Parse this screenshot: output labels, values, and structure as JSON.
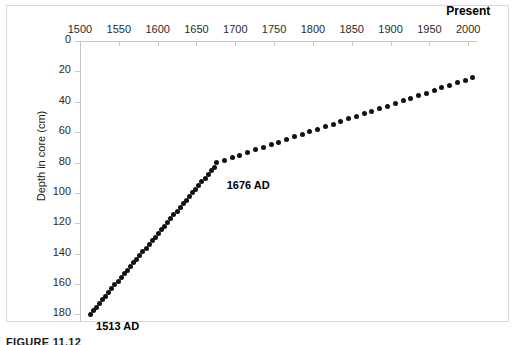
{
  "figure": {
    "caption": "FIGURE 11.12",
    "present_label": "Present"
  },
  "chart_data": {
    "type": "scatter",
    "title": "",
    "xlabel": "",
    "ylabel": "Depth in core (cm)",
    "x_axis_position": "top",
    "y_axis_inverted": true,
    "xlim": [
      1500,
      2010
    ],
    "ylim": [
      185,
      0
    ],
    "xticks": [
      1500,
      1550,
      1600,
      1650,
      1700,
      1750,
      1800,
      1850,
      1900,
      1950,
      2000
    ],
    "yticks": [
      0,
      20,
      40,
      60,
      80,
      100,
      120,
      140,
      160,
      180
    ],
    "xtick_labels": [
      "1500",
      "1550",
      "1600",
      "1650",
      "1700",
      "1750",
      "1800",
      "1850",
      "1900",
      "1950",
      "2000"
    ],
    "ytick_labels": [
      "0",
      "20",
      "40",
      "60",
      "80",
      "100",
      "120",
      "140",
      "160",
      "180"
    ],
    "grid": false,
    "legend": "none",
    "marker": "filled-circle",
    "marker_color": "#111111",
    "annotations": [
      {
        "text": "1513 AD",
        "x": 1513,
        "y": 180,
        "dx": 6,
        "dy": 6
      },
      {
        "text": "1676 AD",
        "x": 1676,
        "y": 80,
        "dx": 10,
        "dy": 16
      }
    ],
    "series": [
      {
        "name": "Age-depth model",
        "points": [
          [
            1513,
            180.0
          ],
          [
            1517,
            177.6
          ],
          [
            1521,
            175.2
          ],
          [
            1525,
            172.7
          ],
          [
            1529,
            170.3
          ],
          [
            1533,
            167.9
          ],
          [
            1537,
            165.5
          ],
          [
            1541,
            163.0
          ],
          [
            1545,
            160.6
          ],
          [
            1549,
            158.2
          ],
          [
            1553,
            155.8
          ],
          [
            1557,
            153.3
          ],
          [
            1561,
            150.9
          ],
          [
            1565,
            148.5
          ],
          [
            1569,
            146.1
          ],
          [
            1573,
            143.6
          ],
          [
            1577,
            141.2
          ],
          [
            1581,
            138.8
          ],
          [
            1585,
            136.4
          ],
          [
            1589,
            133.9
          ],
          [
            1593,
            131.5
          ],
          [
            1597,
            129.1
          ],
          [
            1601,
            126.7
          ],
          [
            1605,
            124.2
          ],
          [
            1609,
            121.8
          ],
          [
            1613,
            119.4
          ],
          [
            1617,
            117.0
          ],
          [
            1621,
            114.5
          ],
          [
            1625,
            112.1
          ],
          [
            1629,
            109.7
          ],
          [
            1633,
            107.3
          ],
          [
            1637,
            104.8
          ],
          [
            1641,
            102.4
          ],
          [
            1645,
            100.0
          ],
          [
            1649,
            97.6
          ],
          [
            1653,
            95.1
          ],
          [
            1657,
            92.7
          ],
          [
            1661,
            90.3
          ],
          [
            1665,
            87.9
          ],
          [
            1669,
            85.4
          ],
          [
            1673,
            83.0
          ],
          [
            1676,
            80.0
          ],
          [
            1686,
            78.5
          ],
          [
            1696,
            76.8
          ],
          [
            1706,
            75.1
          ],
          [
            1716,
            73.4
          ],
          [
            1726,
            71.7
          ],
          [
            1736,
            70.0
          ],
          [
            1746,
            68.3
          ],
          [
            1756,
            66.6
          ],
          [
            1766,
            64.9
          ],
          [
            1776,
            63.2
          ],
          [
            1786,
            61.5
          ],
          [
            1796,
            59.8
          ],
          [
            1806,
            58.1
          ],
          [
            1816,
            56.4
          ],
          [
            1826,
            54.7
          ],
          [
            1836,
            53.0
          ],
          [
            1846,
            51.3
          ],
          [
            1856,
            49.6
          ],
          [
            1866,
            47.9
          ],
          [
            1876,
            46.2
          ],
          [
            1886,
            44.5
          ],
          [
            1896,
            42.8
          ],
          [
            1906,
            41.1
          ],
          [
            1916,
            39.4
          ],
          [
            1926,
            37.7
          ],
          [
            1936,
            36.0
          ],
          [
            1946,
            34.3
          ],
          [
            1956,
            32.6
          ],
          [
            1966,
            30.9
          ],
          [
            1976,
            29.2
          ],
          [
            1986,
            27.5
          ],
          [
            1996,
            25.8
          ],
          [
            2006,
            24.1
          ]
        ]
      }
    ],
    "segments": [
      {
        "name": "lower-segment",
        "from_year": 1513,
        "to_year": 1676,
        "from_depth": 180,
        "to_depth": 80,
        "sedimentation_rate_cm_per_yr": 0.61
      },
      {
        "name": "upper-segment",
        "from_year": 1676,
        "to_year": 2006,
        "from_depth": 80,
        "to_depth": 3,
        "sedimentation_rate_cm_per_yr": 0.23
      }
    ]
  }
}
